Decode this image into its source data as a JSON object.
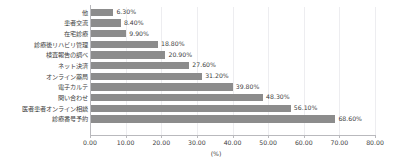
{
  "chart_data": {
    "type": "bar",
    "orientation": "horizontal",
    "title": "",
    "xlabel": "(%)",
    "ylabel": "",
    "xlim": [
      0,
      80
    ],
    "xtick_labels": [
      "0.00",
      "10.00",
      "20.00",
      "30.00",
      "40.00",
      "50.00",
      "60.00",
      "70.00",
      "80.00"
    ],
    "xtick_values": [
      0,
      10,
      20,
      30,
      40,
      50,
      60,
      70,
      80
    ],
    "grid": true,
    "legend": false,
    "bar_color": "#8c8c8c",
    "categories": [
      "他",
      "患者交流",
      "在宅診療",
      "診療後リハビリ管理",
      "検査報告の調べ",
      "ネット決済",
      "オンライン薬局",
      "電子カルテ",
      "問い合わせ",
      "医者患者オンライン相談",
      "診療番号予約"
    ],
    "values": [
      6.3,
      8.4,
      9.9,
      18.8,
      20.9,
      27.6,
      31.2,
      39.8,
      48.3,
      56.1,
      68.6
    ],
    "value_labels": [
      "6.30%",
      "8.40%",
      "9.90%",
      "18.80%",
      "20.90%",
      "27.60%",
      "31.20%",
      "39.80%",
      "48.30%",
      "56.10%",
      "68.60%"
    ]
  }
}
